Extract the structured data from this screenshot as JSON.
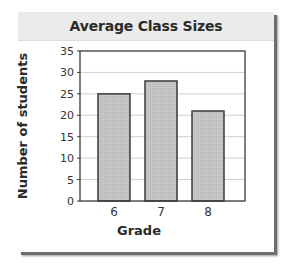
{
  "chart_data": {
    "type": "bar",
    "title": "Average Class Sizes",
    "xlabel": "Grade",
    "ylabel": "Number of students",
    "categories": [
      "6",
      "7",
      "8"
    ],
    "values": [
      25,
      28,
      21
    ],
    "ylim": [
      0,
      35
    ],
    "yticks": [
      0,
      5,
      10,
      15,
      20,
      25,
      30,
      35
    ],
    "grid": true,
    "legend": null,
    "colors": {
      "bar_fill": "#c8c8c8",
      "bar_stroke": "#3a3a3a",
      "grid": "#cfcfcf",
      "axis": "#3a3a3a"
    }
  }
}
